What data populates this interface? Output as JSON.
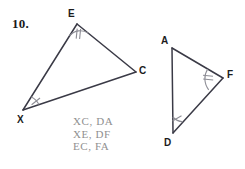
{
  "problem": {
    "number_label": "10."
  },
  "figures": {
    "left_triangle": {
      "name": "triangle-xec",
      "vertices": [
        {
          "id": "E",
          "label": "E",
          "x": 77,
          "y": 24,
          "label_x": 68,
          "label_y": 9,
          "tick_count": 2
        },
        {
          "id": "C",
          "label": "C",
          "x": 136,
          "y": 72,
          "label_x": 139,
          "label_y": 66,
          "tick_count": 0
        },
        {
          "id": "X",
          "label": "X",
          "x": 23,
          "y": 110,
          "label_x": 17,
          "label_y": 115,
          "tick_count": 1
        }
      ],
      "edges": [
        "E-C",
        "C-X",
        "X-E"
      ]
    },
    "right_triangle": {
      "name": "triangle-adf",
      "vertices": [
        {
          "id": "A",
          "label": "A",
          "x": 172,
          "y": 48,
          "label_x": 161,
          "label_y": 36,
          "tick_count": 0
        },
        {
          "id": "F",
          "label": "F",
          "x": 223,
          "y": 78,
          "label_x": 227,
          "label_y": 70,
          "tick_count": 2
        },
        {
          "id": "D",
          "label": "D",
          "x": 173,
          "y": 133,
          "label_x": 164,
          "label_y": 138,
          "tick_count": 1
        }
      ],
      "edges": [
        "A-F",
        "F-D",
        "D-A"
      ]
    }
  },
  "answer": {
    "lines": [
      "XC, DA",
      "XE, DF",
      "EC, FA"
    ],
    "line_0": "XC, DA",
    "line_1": "XE, DF",
    "line_2": "EC, FA",
    "color": "#909090"
  },
  "style": {
    "stroke_color": "#3a3a46",
    "tick_color": "#8d8d95",
    "background": "#ffffff"
  }
}
